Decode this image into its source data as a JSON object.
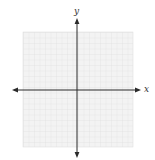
{
  "diagram": {
    "type": "coordinate-plane",
    "x_axis_label": "x",
    "y_axis_label": "y",
    "grid": {
      "columns": 20,
      "rows": 20,
      "color": "#e4e4e4",
      "background": "#f4f4f4"
    },
    "axis_color": "#2a2a2a"
  }
}
